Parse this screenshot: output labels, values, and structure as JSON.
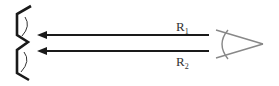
{
  "diagram": {
    "type": "ray diagram",
    "rays": [
      {
        "label": "R",
        "subscript": "1",
        "y": 35
      },
      {
        "label": "R",
        "subscript": "2",
        "y": 51
      }
    ],
    "object": "two-eye-object",
    "observer": "eye-icon",
    "colors": {
      "ray": "#1a1a1a",
      "object": "#1a1a1a",
      "eye": "#888888",
      "label": "#333333"
    }
  }
}
